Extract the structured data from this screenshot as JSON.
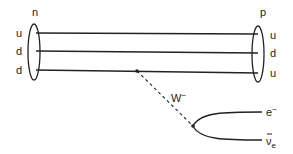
{
  "diagram": {
    "type": "feynman-diagram",
    "initial_particle": {
      "label": "n",
      "quarks": [
        "u",
        "d",
        "d"
      ]
    },
    "final_particle": {
      "label": "p",
      "quarks": [
        "u",
        "d",
        "u"
      ]
    },
    "boson": {
      "label": "W",
      "charge": "−"
    },
    "leptons": [
      {
        "label": "e",
        "superscript": "−"
      },
      {
        "label": "ν",
        "bar": true,
        "subscript": "e"
      }
    ],
    "colors": {
      "line": "#222222",
      "background": "#ffffff"
    }
  }
}
